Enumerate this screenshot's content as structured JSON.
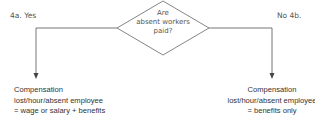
{
  "decision": {
    "question_lines": [
      "Are",
      "absent workers",
      "paid?"
    ]
  },
  "branches": {
    "yes": {
      "label": "4a.  Yes",
      "result_lines": [
        "Compensation",
        "lost/hour/absent employee",
        "= wage or salary + benefits"
      ]
    },
    "no": {
      "label": "No  4b.",
      "result_lines": [
        "Compensation",
        "lost/hour/absent employee",
        "= benefits only"
      ]
    }
  }
}
